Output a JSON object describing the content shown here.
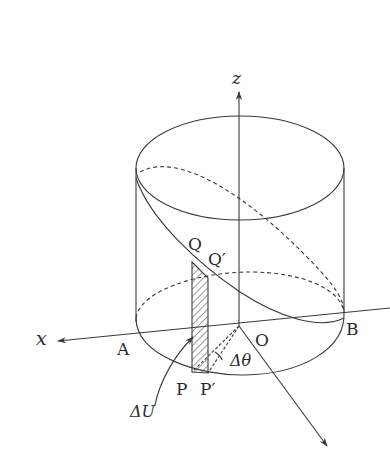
{
  "figure": {
    "stroke_color": "#3a3a3a",
    "background": "#ffffff"
  },
  "labels": {
    "z_axis": "z",
    "x_axis": "x",
    "origin": "O",
    "point_A": "A",
    "point_B": "B",
    "point_P": "P",
    "point_P_prime": "P′",
    "point_Q": "Q",
    "point_Q_prime": "Q′",
    "delta_theta": "Δθ",
    "delta_U": "ΔU"
  }
}
